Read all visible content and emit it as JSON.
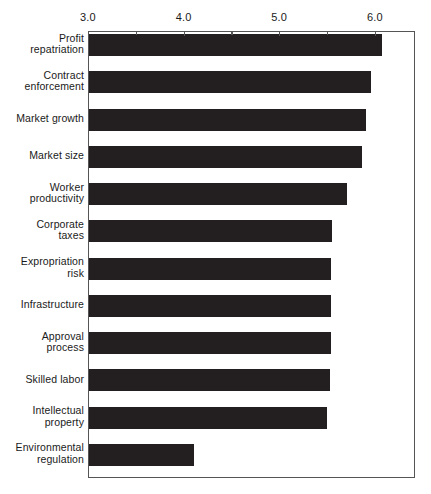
{
  "chart_data": {
    "type": "bar",
    "orientation": "horizontal",
    "title": "",
    "subtitle": "",
    "xlabel": "",
    "ylabel": "",
    "xlim": [
      3.0,
      6.42
    ],
    "grid": false,
    "legend": null,
    "axis_position": "top",
    "tick_labels": [
      "3.0",
      "4.0",
      "5.0",
      "6.0"
    ],
    "tick_values": [
      3.0,
      4.0,
      5.0,
      6.0
    ],
    "minor_tick_values": [
      3.5,
      4.5,
      5.5
    ],
    "bar_color": "#231f20",
    "categories": [
      "Profit repatriation",
      "Contract enforcement",
      "Market growth",
      "Market size",
      "Worker productivity",
      "Corporate taxes",
      "Expropriation risk",
      "Infrastructure",
      "Approval process",
      "Skilled labor",
      "Intellectual property",
      "Environmental regulation"
    ],
    "category_lines": [
      [
        "Profit",
        "repatriation"
      ],
      [
        "Contract",
        "enforcement"
      ],
      [
        "Market growth"
      ],
      [
        "Market size"
      ],
      [
        "Worker",
        "productivity"
      ],
      [
        "Corporate",
        "taxes"
      ],
      [
        "Expropriation",
        "risk"
      ],
      [
        "Infrastructure"
      ],
      [
        "Approval",
        "process"
      ],
      [
        "Skilled labor"
      ],
      [
        "Intellectual",
        "property"
      ],
      [
        "Environmental",
        "regulation"
      ]
    ],
    "values": [
      6.06,
      5.95,
      5.9,
      5.85,
      5.7,
      5.54,
      5.53,
      5.53,
      5.53,
      5.52,
      5.49,
      4.1
    ]
  }
}
